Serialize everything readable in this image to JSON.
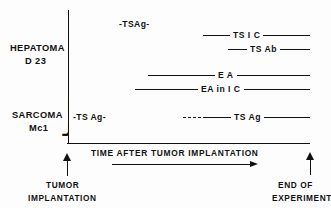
{
  "chart_data": {
    "type": "table",
    "title": "",
    "xlabel": "TIME AFTER TUMOR IMPLANTATION",
    "ylabel": "",
    "grid": false,
    "legend": "none",
    "axis": {
      "x_start_marker": "TUMOR IMPLANTATION",
      "x_end_marker": "END OF EXPERIMENT",
      "x_arrow_direction": "right"
    },
    "groups": [
      {
        "name_line1": "HEPATOMA",
        "name_line2": "D 23",
        "annotation": "-TSAg-",
        "bars": [
          {
            "label": "TS   I C",
            "start_pct": 56,
            "end_pct": 100,
            "style": "solid"
          },
          {
            "label": "TS Ab",
            "start_pct": 66,
            "end_pct": 100,
            "style": "solid"
          },
          {
            "label": "E A",
            "start_pct": 33,
            "end_pct": 100,
            "style": "solid"
          },
          {
            "label": "EA  in  I C",
            "start_pct": 28,
            "end_pct": 100,
            "style": "solid"
          }
        ]
      },
      {
        "name_line1": "SARCOMA",
        "name_line2": "Mc1",
        "annotation": "-TS Ag-",
        "bars": [
          {
            "label": "TS Ag",
            "start_pct": 48,
            "end_pct": 100,
            "style": "dashed-then-solid"
          }
        ]
      }
    ]
  },
  "groups": {
    "hepatoma": {
      "line1": "HEPATOMA",
      "line2": "D 23",
      "annotation": "-TSAg-"
    },
    "sarcoma": {
      "line1": "SARCOMA",
      "line2": "Mc1",
      "annotation": "-TS Ag-"
    }
  },
  "bars": {
    "ts_ic": {
      "label": "TS   I C"
    },
    "ts_ab": {
      "label": "TS Ab"
    },
    "ea": {
      "label": "E A"
    },
    "ea_in_ic": {
      "label": "EA  in  I C"
    },
    "ts_ag": {
      "label": "TS Ag"
    }
  },
  "axis": {
    "caption": "TIME  AFTER  TUMOR  IMPLANTATION"
  },
  "callouts": {
    "implantation": {
      "line1": "TUMOR",
      "line2": "IMPLANTATION"
    },
    "end": {
      "line1": "END OF",
      "line2": "EXPERIMENT"
    }
  },
  "braces": {
    "glyph": "}"
  },
  "colors": {
    "ink": "#111111",
    "background": "#fdfdfd"
  }
}
